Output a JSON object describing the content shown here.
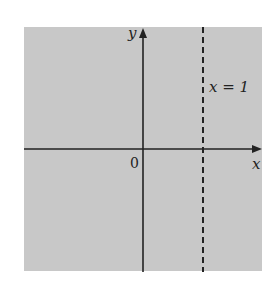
{
  "diagram": {
    "background_color": "#ffffff",
    "region_color": "#c8c8c8",
    "axis_color": "#222222",
    "labels": {
      "y_axis": "y",
      "x_axis": "x",
      "origin": "0",
      "line": "x = 1"
    },
    "shaded_region": "entire plane",
    "boundary": {
      "equation": "x = 1",
      "style": "dashed",
      "orientation": "vertical"
    }
  }
}
